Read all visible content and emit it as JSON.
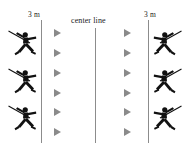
{
  "diagram": {
    "labels": {
      "left_distance": "3 m",
      "right_distance": "3 m",
      "center_line": "center line"
    },
    "colors": {
      "line": "#8c8c8c",
      "marker": "#8a8a8a",
      "athlete": "#111111",
      "background": "#ffffff",
      "text": "#1a1a1a"
    },
    "lines": [
      {
        "name": "left-boundary-line",
        "x": 41,
        "y": 20,
        "height": 123
      },
      {
        "name": "center-line",
        "x": 95,
        "y": 28,
        "height": 115
      },
      {
        "name": "right-boundary-line",
        "x": 148,
        "y": 20,
        "height": 123
      }
    ],
    "left_side": {
      "athletes": [
        {
          "y": 28
        },
        {
          "y": 66
        },
        {
          "y": 103
        }
      ],
      "markers": [
        {
          "x": 54,
          "y": 29
        },
        {
          "x": 54,
          "y": 49
        },
        {
          "x": 54,
          "y": 69
        },
        {
          "x": 54,
          "y": 89
        },
        {
          "x": 54,
          "y": 108
        },
        {
          "x": 54,
          "y": 128
        }
      ]
    },
    "right_side": {
      "athletes": [
        {
          "y": 28
        },
        {
          "y": 66
        },
        {
          "y": 103
        }
      ],
      "markers": [
        {
          "x": 124,
          "y": 29
        },
        {
          "x": 124,
          "y": 49
        },
        {
          "x": 124,
          "y": 69
        },
        {
          "x": 124,
          "y": 89
        },
        {
          "x": 124,
          "y": 108
        },
        {
          "x": 124,
          "y": 128
        }
      ]
    },
    "counts": {
      "athletes_per_side": 3,
      "markers_per_side": 6
    }
  }
}
